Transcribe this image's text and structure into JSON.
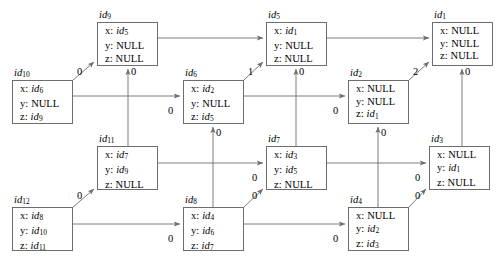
{
  "diagram": {
    "type": "object-reference-graph",
    "stroke_color": "#6d6d6d",
    "text_color": "#000000",
    "background": "#ffffff",
    "field_keys": [
      "x:",
      "y:",
      "z:"
    ],
    "nodes": [
      {
        "id": "id9",
        "label": "id",
        "sub": "9",
        "x": 97,
        "y": 22,
        "w": 61,
        "h": 44,
        "label_x": 99,
        "label_y": 9,
        "fields": [
          {
            "key": "x:",
            "value": "id",
            "value_sub": "5",
            "italic": true
          },
          {
            "key": "y:",
            "value": "NULL",
            "value_sub": "",
            "italic": false
          },
          {
            "key": "z:",
            "value": "NULL",
            "value_sub": "",
            "italic": false
          }
        ]
      },
      {
        "id": "id5",
        "label": "id",
        "sub": "5",
        "x": 266,
        "y": 22,
        "w": 61,
        "h": 44,
        "label_x": 268,
        "label_y": 9,
        "fields": [
          {
            "key": "x:",
            "value": "id",
            "value_sub": "1",
            "italic": true
          },
          {
            "key": "y:",
            "value": "NULL",
            "value_sub": "",
            "italic": false
          },
          {
            "key": "z:",
            "value": "NULL",
            "value_sub": "",
            "italic": false
          }
        ]
      },
      {
        "id": "id1",
        "label": "id",
        "sub": "1",
        "x": 432,
        "y": 22,
        "w": 61,
        "h": 44,
        "label_x": 434,
        "label_y": 9,
        "fields": [
          {
            "key": "x:",
            "value": "NULL",
            "value_sub": "",
            "italic": false
          },
          {
            "key": "y:",
            "value": "NULL",
            "value_sub": "",
            "italic": false
          },
          {
            "key": "z:",
            "value": "NULL",
            "value_sub": "",
            "italic": false
          }
        ]
      },
      {
        "id": "id10",
        "label": "id",
        "sub": "10",
        "x": 12,
        "y": 80,
        "w": 61,
        "h": 44,
        "label_x": 14,
        "label_y": 67,
        "fields": [
          {
            "key": "x:",
            "value": "id",
            "value_sub": "6",
            "italic": true
          },
          {
            "key": "y:",
            "value": "NULL",
            "value_sub": "",
            "italic": false
          },
          {
            "key": "z:",
            "value": "id",
            "value_sub": "9",
            "italic": true
          }
        ]
      },
      {
        "id": "id6",
        "label": "id",
        "sub": "6",
        "x": 183,
        "y": 80,
        "w": 61,
        "h": 44,
        "label_x": 185,
        "label_y": 67,
        "fields": [
          {
            "key": "x:",
            "value": "id",
            "value_sub": "2",
            "italic": true
          },
          {
            "key": "y:",
            "value": "NULL",
            "value_sub": "",
            "italic": false
          },
          {
            "key": "z:",
            "value": "id",
            "value_sub": "5",
            "italic": true
          }
        ]
      },
      {
        "id": "id2",
        "label": "id",
        "sub": "2",
        "x": 348,
        "y": 80,
        "w": 61,
        "h": 44,
        "label_x": 350,
        "label_y": 67,
        "fields": [
          {
            "key": "x:",
            "value": "NULL",
            "value_sub": "",
            "italic": false
          },
          {
            "key": "y:",
            "value": "NULL",
            "value_sub": "",
            "italic": false
          },
          {
            "key": "z:",
            "value": "id",
            "value_sub": "1",
            "italic": true
          }
        ]
      },
      {
        "id": "id11",
        "label": "id",
        "sub": "11",
        "x": 97,
        "y": 146,
        "w": 61,
        "h": 44,
        "label_x": 99,
        "label_y": 133,
        "fields": [
          {
            "key": "x:",
            "value": "id",
            "value_sub": "7",
            "italic": true
          },
          {
            "key": "y:",
            "value": "id",
            "value_sub": "9",
            "italic": true
          },
          {
            "key": "z:",
            "value": "NULL",
            "value_sub": "",
            "italic": false
          }
        ]
      },
      {
        "id": "id7",
        "label": "id",
        "sub": "7",
        "x": 266,
        "y": 146,
        "w": 61,
        "h": 44,
        "label_x": 268,
        "label_y": 133,
        "fields": [
          {
            "key": "x:",
            "value": "id",
            "value_sub": "3",
            "italic": true
          },
          {
            "key": "y:",
            "value": "id",
            "value_sub": "5",
            "italic": true
          },
          {
            "key": "z:",
            "value": "NULL",
            "value_sub": "",
            "italic": false
          }
        ]
      },
      {
        "id": "id3",
        "label": "id",
        "sub": "3",
        "x": 429,
        "y": 146,
        "w": 61,
        "h": 44,
        "label_x": 431,
        "label_y": 133,
        "fields": [
          {
            "key": "x:",
            "value": "NULL",
            "value_sub": "",
            "italic": false
          },
          {
            "key": "y:",
            "value": "id",
            "value_sub": "1",
            "italic": true
          },
          {
            "key": "z:",
            "value": "NULL",
            "value_sub": "",
            "italic": false
          }
        ]
      },
      {
        "id": "id12",
        "label": "id",
        "sub": "12",
        "x": 12,
        "y": 207,
        "w": 61,
        "h": 44,
        "label_x": 14,
        "label_y": 194,
        "fields": [
          {
            "key": "x:",
            "value": "id",
            "value_sub": "8",
            "italic": true
          },
          {
            "key": "y:",
            "value": "id",
            "value_sub": "10",
            "italic": true
          },
          {
            "key": "z:",
            "value": "id",
            "value_sub": "11",
            "italic": true
          }
        ]
      },
      {
        "id": "id8",
        "label": "id",
        "sub": "8",
        "x": 183,
        "y": 207,
        "w": 61,
        "h": 44,
        "label_x": 185,
        "label_y": 194,
        "fields": [
          {
            "key": "x:",
            "value": "id",
            "value_sub": "4",
            "italic": true
          },
          {
            "key": "y:",
            "value": "id",
            "value_sub": "6",
            "italic": true
          },
          {
            "key": "z:",
            "value": "id",
            "value_sub": "7",
            "italic": true
          }
        ]
      },
      {
        "id": "id4",
        "label": "id",
        "sub": "4",
        "x": 348,
        "y": 207,
        "w": 61,
        "h": 44,
        "label_x": 350,
        "label_y": 194,
        "fields": [
          {
            "key": "x:",
            "value": "NULL",
            "value_sub": "",
            "italic": false
          },
          {
            "key": "y:",
            "value": "id",
            "value_sub": "2",
            "italic": true
          },
          {
            "key": "z:",
            "value": "id",
            "value_sub": "3",
            "italic": true
          }
        ]
      }
    ],
    "edges": [
      {
        "name": "edge-id10-to-id9",
        "from": "id10",
        "to": "id9",
        "label": "0",
        "path": "M 73,80 L 94,62",
        "label_x": 77,
        "label_y": 66
      },
      {
        "name": "edge-id11-to-id9",
        "from": "id11",
        "to": "id9",
        "label": "0",
        "path": "M 128,146 L 128,69",
        "label_x": 131,
        "label_y": 66
      },
      {
        "name": "edge-id9-to-id5",
        "from": "id9",
        "to": "id5",
        "label": "",
        "path": "M 158,38 L 263,38",
        "label_x": 0,
        "label_y": 0
      },
      {
        "name": "edge-id6-to-id5",
        "from": "id6",
        "to": "id5",
        "label": "1",
        "path": "M 244,80 L 263,62",
        "label_x": 248,
        "label_y": 66
      },
      {
        "name": "edge-id7-to-id5",
        "from": "id7",
        "to": "id5",
        "label": "0",
        "path": "M 296,146 L 296,69",
        "label_x": 299,
        "label_y": 66
      },
      {
        "name": "edge-id5-to-id1",
        "from": "id5",
        "to": "id1",
        "label": "",
        "path": "M 327,38 L 429,38",
        "label_x": 0,
        "label_y": 0
      },
      {
        "name": "edge-id2-to-id1",
        "from": "id2",
        "to": "id1",
        "label": "2",
        "path": "M 409,80 L 429,62",
        "label_x": 413,
        "label_y": 66
      },
      {
        "name": "edge-id3-to-id1",
        "from": "id3",
        "to": "id1",
        "label": "0",
        "path": "M 462,146 L 462,69",
        "label_x": 465,
        "label_y": 66
      },
      {
        "name": "edge-id10-to-id6",
        "from": "id10",
        "to": "id6",
        "label": "0",
        "path": "M 73,96 L 180,96",
        "label_x": 168,
        "label_y": 105
      },
      {
        "name": "edge-id8-to-id6",
        "from": "id8",
        "to": "id6",
        "label": "0",
        "path": "M 213,207 L 213,127",
        "label_x": 216,
        "label_y": 127
      },
      {
        "name": "edge-id6-to-id2",
        "from": "id6",
        "to": "id2",
        "label": "0",
        "path": "M 244,96 L 345,96",
        "label_x": 333,
        "label_y": 105
      },
      {
        "name": "edge-id4-to-id2",
        "from": "id4",
        "to": "id2",
        "label": "0",
        "path": "M 378,207 L 378,127",
        "label_x": 381,
        "label_y": 127
      },
      {
        "name": "edge-id12-to-id11",
        "from": "id12",
        "to": "id11",
        "label": "0",
        "path": "M 73,207 L 94,189",
        "label_x": 77,
        "label_y": 190
      },
      {
        "name": "edge-id11-to-id7",
        "from": "id11",
        "to": "id7",
        "label": "0",
        "path": "M 158,163 L 263,163",
        "label_x": 252,
        "label_y": 172
      },
      {
        "name": "edge-id8-to-id7",
        "from": "id8",
        "to": "id7",
        "label": "0",
        "path": "M 244,207 L 263,189",
        "label_x": 252,
        "label_y": 190
      },
      {
        "name": "edge-id7-to-id3",
        "from": "id7",
        "to": "id3",
        "label": "0",
        "path": "M 327,163 L 426,163",
        "label_x": 415,
        "label_y": 172
      },
      {
        "name": "edge-id4-to-id3",
        "from": "id4",
        "to": "id3",
        "label": "0",
        "path": "M 409,207 L 426,189",
        "label_x": 415,
        "label_y": 190
      },
      {
        "name": "edge-id12-to-id8",
        "from": "id12",
        "to": "id8",
        "label": "0",
        "path": "M 73,224 L 180,224",
        "label_x": 168,
        "label_y": 233
      },
      {
        "name": "edge-id8-to-id4",
        "from": "id8",
        "to": "id4",
        "label": "0",
        "path": "M 244,224 L 345,224",
        "label_x": 333,
        "label_y": 233
      }
    ]
  }
}
